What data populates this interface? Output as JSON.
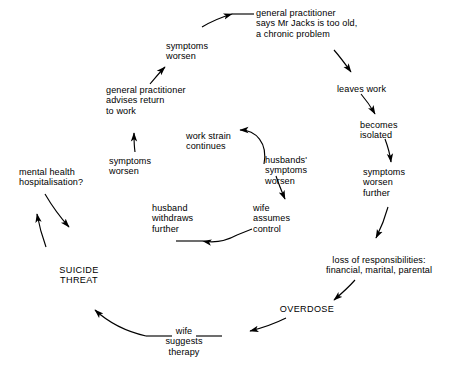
{
  "diagram": {
    "type": "cyclic-flow-diagram",
    "background_color": "#ffffff",
    "line_color": "#000000",
    "outer_loop_direction": "clockwise",
    "inner_loop_direction": "counter-clockwise",
    "outer_nodes": [
      {
        "id": "gp-too-old",
        "label": "general practitioner\nsays Mr Jacks is too old,\na chronic problem"
      },
      {
        "id": "leaves-work",
        "label": "leaves work"
      },
      {
        "id": "becomes-isolated",
        "label": "becomes\nisolated"
      },
      {
        "id": "symptoms-worsen-further",
        "label": "symptoms\nworsen\nfurther"
      },
      {
        "id": "loss-of-responsibilities",
        "label": "loss of responsibilities:\nfinancial, marital, parental"
      },
      {
        "id": "overdose",
        "label": "OVERDOSE"
      },
      {
        "id": "wife-suggests-therapy",
        "label": "wife\nsuggests\ntherapy"
      },
      {
        "id": "suicide-threat",
        "label": "SUICIDE\nTHREAT"
      },
      {
        "id": "mental-health-hospitalisation",
        "label": "mental health\nhospitalisation?"
      },
      {
        "id": "symptoms-worsen-left",
        "label": "symptoms\nworsen"
      },
      {
        "id": "gp-advises-return",
        "label": "general practitioner\nadvises return\nto work"
      },
      {
        "id": "symptoms-worsen-top",
        "label": "symptoms\nworsen"
      }
    ],
    "inner_nodes": [
      {
        "id": "work-strain-continues",
        "label": "work strain\ncontinues"
      },
      {
        "id": "husbands-symptoms-worsen",
        "label": "husbands'\nsymptoms\nworsen"
      },
      {
        "id": "wife-assumes-control",
        "label": "wife\nassumes\ncontrol"
      },
      {
        "id": "husband-withdraws-further",
        "label": "husband\nwithdraws\nfurther"
      }
    ]
  }
}
